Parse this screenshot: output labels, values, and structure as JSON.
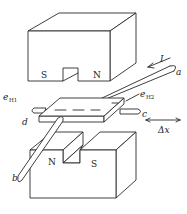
{
  "diagram": {
    "type": "hall-effect-sensor-illustration",
    "top_magnet": {
      "left_pole": "S",
      "right_pole": "N"
    },
    "bottom_magnet": {
      "left_pole": "N",
      "right_pole": "S"
    },
    "current": {
      "symbol": "I"
    },
    "terminals": {
      "a": "a",
      "b": "b",
      "c": "c",
      "d": "d"
    },
    "hall_voltages": {
      "eH1": {
        "base": "e",
        "sub": "H1"
      },
      "eH2": {
        "base": "e",
        "sub": "H2"
      }
    },
    "displacement": {
      "label": "Δx"
    },
    "colors": {
      "stroke": "#2a2a2a",
      "background": "#ffffff"
    }
  }
}
